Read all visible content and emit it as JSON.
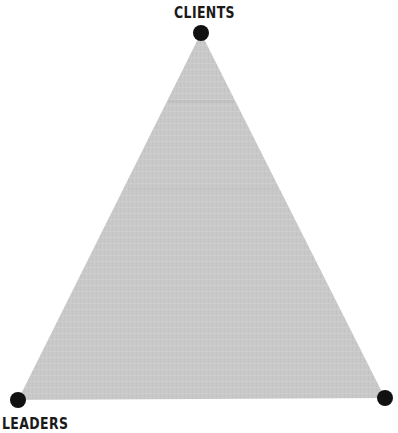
{
  "diagram": {
    "type": "triangle",
    "fill_color": "#c8c8c8",
    "node_color": "#111111",
    "vertices": [
      {
        "id": "top",
        "label": "CLIENTS",
        "x": 201,
        "y": 33
      },
      {
        "id": "bottom-left",
        "label": "LEADERS",
        "x": 18,
        "y": 400
      },
      {
        "id": "bottom-right",
        "label": "",
        "x": 385,
        "y": 398
      }
    ]
  }
}
